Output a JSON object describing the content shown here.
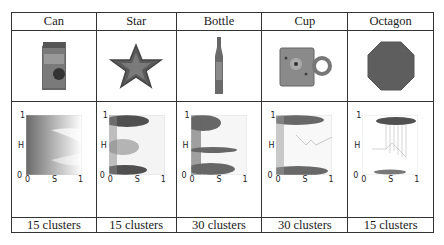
{
  "table": {
    "columns": [
      {
        "name": "Can",
        "icon": "milk-carton-object-photo",
        "clusters": "15 clusters"
      },
      {
        "name": "Star",
        "icon": "star-object-photo",
        "clusters": "15 clusters"
      },
      {
        "name": "Bottle",
        "icon": "bottle-object-photo",
        "clusters": "30 clusters"
      },
      {
        "name": "Cup",
        "icon": "mug-object-photo",
        "clusters": "30 clusters"
      },
      {
        "name": "Octagon",
        "icon": "octagon-object-photo",
        "clusters": "15 clusters"
      }
    ],
    "axis": {
      "h_label": "H",
      "s_label": "S",
      "one": "1",
      "zero": "0"
    }
  }
}
